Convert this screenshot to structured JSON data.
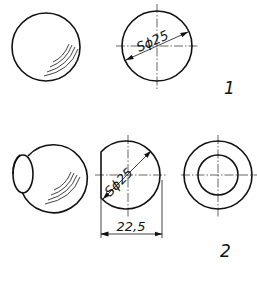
{
  "figures": [
    {
      "id": "1",
      "label": "1",
      "views": [
        {
          "name": "sphere-pictorial",
          "shape": "sphere"
        },
        {
          "name": "sphere-orthographic",
          "shape": "circle",
          "dimension": "Sϕ25"
        }
      ]
    },
    {
      "id": "2",
      "label": "2",
      "views": [
        {
          "name": "truncated-sphere-pictorial",
          "shape": "sphere-with-flat"
        },
        {
          "name": "truncated-sphere-front",
          "shape": "truncated-circle",
          "dimension": "Sϕ25",
          "width_dimension": "22,5"
        },
        {
          "name": "truncated-sphere-side",
          "shape": "concentric-circles"
        }
      ]
    }
  ],
  "labels": {
    "fig1": "1",
    "fig2": "2",
    "dim_sphere_1": "Sϕ25",
    "dim_sphere_2": "Sϕ25",
    "dim_width_2": "22,5"
  },
  "colors": {
    "line": "#111111",
    "background": "#ffffff"
  }
}
